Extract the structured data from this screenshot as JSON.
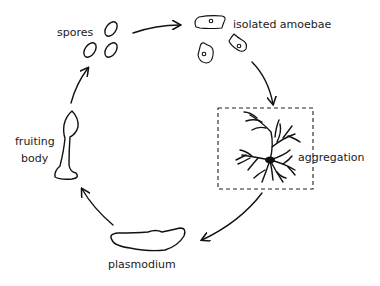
{
  "stages": [
    {
      "id": "spores",
      "label": "spores"
    },
    {
      "id": "amoebae",
      "label": "isolated amoebae"
    },
    {
      "id": "aggregation",
      "label": "aggregation"
    },
    {
      "id": "plasmodium",
      "label": "plasmodium"
    },
    {
      "id": "fruiting-body",
      "label_lines": [
        "fruiting",
        "body"
      ]
    }
  ],
  "cycle_order": [
    "spores",
    "isolated amoebae",
    "aggregation",
    "plasmodium",
    "fruiting body"
  ],
  "colors": {
    "ink": "#111111",
    "background": "#ffffff"
  }
}
